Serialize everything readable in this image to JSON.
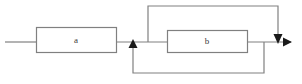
{
  "diagram": {
    "type": "block-diagram",
    "background_color": "#ffffff",
    "stroke_color": "#808080",
    "arrow_color": "#1a1a1a",
    "label_color": "#3a3a3a",
    "blocks": [
      {
        "id": "block-a",
        "label": "a",
        "x": 36,
        "y": 27,
        "width": 80,
        "height": 25,
        "label_x": 76,
        "label_y": 40
      },
      {
        "id": "block-b",
        "label": "b",
        "x": 167,
        "y": 30,
        "width": 80,
        "height": 22,
        "label_x": 207,
        "label_y": 41
      }
    ],
    "connections": [
      {
        "id": "input-line",
        "description": "input signal entering block a",
        "points": "5,42 36,42",
        "arrow": "none"
      },
      {
        "id": "a-to-junction",
        "description": "output of block a to summing junction",
        "points": "116,42 167,42",
        "arrow": "none"
      },
      {
        "id": "b-to-output",
        "description": "output of block b toward output arrow",
        "points": "247,42 290,42",
        "arrow": "right"
      },
      {
        "id": "top-feedback-loop",
        "description": "feed-forward path around block b from junction to output node",
        "points": "148,42 148,6 278,6 278,42",
        "arrow": "down"
      },
      {
        "id": "bottom-feedback-loop",
        "description": "feedback path from block b output back to summing junction before b",
        "points": "264,42 264,73 133,73 133,40",
        "arrow": "up"
      }
    ],
    "arrowheads": [
      {
        "id": "output-arrowhead",
        "direction": "right",
        "tip_x": 292,
        "tip_y": 42
      },
      {
        "id": "top-loop-arrowhead",
        "direction": "down",
        "tip_x": 278,
        "tip_y": 44
      },
      {
        "id": "feedback-arrowhead",
        "direction": "up",
        "tip_x": 133,
        "tip_y": 39
      }
    ]
  }
}
